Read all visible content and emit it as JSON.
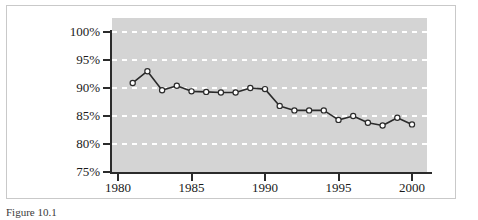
{
  "figure": {
    "caption": "Figure 10.1"
  },
  "chart_data": {
    "type": "line",
    "title": "",
    "xlabel": "",
    "ylabel": "",
    "xlim": [
      1980,
      2001
    ],
    "ylim": [
      75,
      100
    ],
    "grid": true,
    "legend_position": "none",
    "x_ticks": [
      "1980",
      "1985",
      "1990",
      "1995",
      "2000"
    ],
    "x_tick_values": [
      1980,
      1985,
      1990,
      1995,
      2000
    ],
    "y_ticks": [
      "75%",
      "80%",
      "85%",
      "90%",
      "95%",
      "100%"
    ],
    "y_tick_values": [
      75,
      80,
      85,
      90,
      95,
      100
    ],
    "marker": "open-circle",
    "line_color": "#2b2b2b",
    "marker_fill": "#ffffff",
    "plot_background": "#d4d4d4",
    "gridline_color": "#ffffff",
    "x": [
      1981,
      1982,
      1983,
      1984,
      1985,
      1986,
      1987,
      1988,
      1989,
      1990,
      1991,
      1992,
      1993,
      1994,
      1995,
      1996,
      1997,
      1998,
      1999,
      2000
    ],
    "values": [
      90.9,
      93.0,
      89.6,
      90.4,
      89.4,
      89.3,
      89.2,
      89.2,
      90.0,
      89.8,
      86.8,
      86.0,
      86.0,
      86.0,
      84.3,
      85.0,
      83.8,
      83.3,
      84.7,
      83.5
    ],
    "series": [
      {
        "name": "rate",
        "values": [
          90.9,
          93.0,
          89.6,
          90.4,
          89.4,
          89.3,
          89.2,
          89.2,
          90.0,
          89.8,
          86.8,
          86.0,
          86.0,
          86.0,
          84.3,
          85.0,
          83.8,
          83.3,
          84.7,
          83.5
        ]
      }
    ]
  }
}
